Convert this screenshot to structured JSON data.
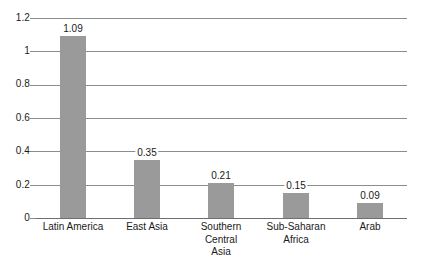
{
  "chart_data": {
    "type": "bar",
    "title": "",
    "subtitle": "",
    "xlabel": "",
    "ylabel": "",
    "ylim": [
      0,
      1.2
    ],
    "yticks": [
      0,
      0.2,
      0.4,
      0.6,
      0.8,
      1,
      1.2
    ],
    "ytick_labels": [
      "0",
      "0.2",
      "0.4",
      "0.6",
      "0.8",
      "1",
      "1.2"
    ],
    "grid": true,
    "legend": "none",
    "categories": [
      "Latin America",
      "East Asia",
      "Southern Central Asia",
      "Sub-Saharan Africa",
      "Arab"
    ],
    "category_lines": [
      [
        "Latin America"
      ],
      [
        "East Asia"
      ],
      [
        "Southern",
        "Central",
        "Asia"
      ],
      [
        "Sub-Saharan",
        "Africa"
      ],
      [
        "Arab"
      ]
    ],
    "values": [
      1.09,
      0.35,
      0.21,
      0.15,
      0.09
    ],
    "value_labels": [
      "1.09",
      "0.35",
      "0.21",
      "0.15",
      "0.09"
    ],
    "bar_color": "#9a9a9a",
    "grid_color": "#8c8c8c",
    "background_color": "#ffffff",
    "text_color": "#1a1a1a"
  }
}
